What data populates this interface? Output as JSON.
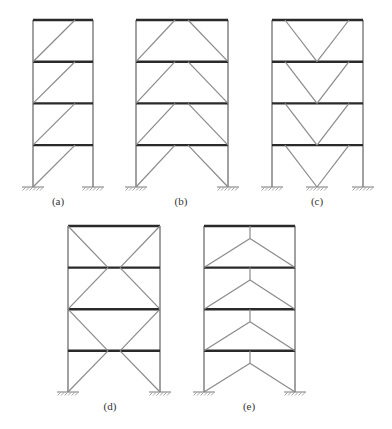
{
  "figure": {
    "stories": 4,
    "frames": [
      {
        "id": "a",
        "label": "(a)",
        "bracing": "single-diagonal-eccentric",
        "supports": 2
      },
      {
        "id": "b",
        "label": "(b)",
        "bracing": "split-k-eccentric-inverted-v",
        "supports": 2
      },
      {
        "id": "c",
        "label": "(c)",
        "bracing": "v-chevron",
        "supports": 3
      },
      {
        "id": "d",
        "label": "(d)",
        "bracing": "two-storey-x-eccentric",
        "supports": 2
      },
      {
        "id": "e",
        "label": "(e)",
        "bracing": "inverted-y-eccentric",
        "supports": 2
      }
    ]
  },
  "colors": {
    "beam": "#2a2a2a",
    "column": "#8a8a8a",
    "brace": "#8a8a8a",
    "background": "#ffffff"
  }
}
